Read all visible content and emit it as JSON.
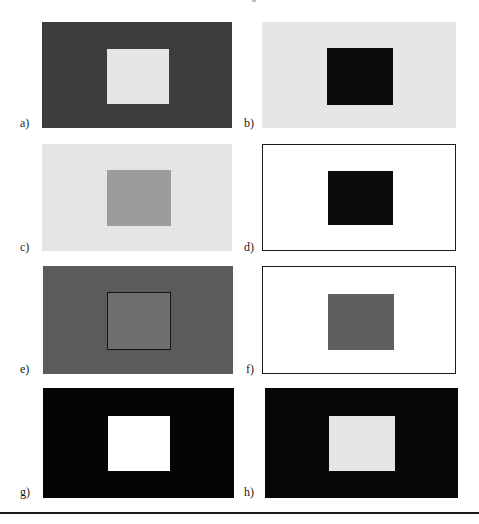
{
  "figure": {
    "panels": [
      {
        "id": "a",
        "label": "a)",
        "background": "#3d3d3d",
        "square": "#e6e6e6",
        "panel_border": false,
        "square_outline": false
      },
      {
        "id": "b",
        "label": "b)",
        "background": "#e6e6e6",
        "square": "#0c0c0c",
        "panel_border": false,
        "square_outline": false
      },
      {
        "id": "c",
        "label": "c)",
        "background": "#e4e4e4",
        "square": "#9c9c9c",
        "panel_border": false,
        "square_outline": false
      },
      {
        "id": "d",
        "label": "d)",
        "background": "#ffffff",
        "square": "#0c0c0c",
        "panel_border": true,
        "square_outline": false
      },
      {
        "id": "e",
        "label": "e)",
        "background": "#5b5b5b",
        "square": "#6f6f6f",
        "panel_border": false,
        "square_outline": true
      },
      {
        "id": "f",
        "label": "f)",
        "background": "#ffffff",
        "square": "#5f5f5f",
        "panel_border": true,
        "square_outline": false
      },
      {
        "id": "g",
        "label": "g)",
        "background": "#050505",
        "square": "#ffffff",
        "panel_border": false,
        "square_outline": false
      },
      {
        "id": "h",
        "label": "h)",
        "background": "#070707",
        "square": "#e6e6e6",
        "panel_border": false,
        "square_outline": false
      }
    ]
  }
}
